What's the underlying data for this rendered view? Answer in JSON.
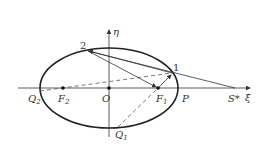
{
  "diagram": {
    "type": "ellipse-geometry",
    "axes": {
      "x_label": "ξ",
      "y_label": "η"
    },
    "ellipse": {
      "cx": 109,
      "cy": 88,
      "rx": 69,
      "ry": 40
    },
    "points": {
      "origin": {
        "label": "O"
      },
      "focus_left": {
        "label": "F",
        "sub": "2"
      },
      "focus_right": {
        "label": "F",
        "sub": "1"
      },
      "vertex_right": {
        "label": "P"
      },
      "external_source": {
        "label": "S*"
      },
      "q_left": {
        "label": "Q",
        "sub": "2"
      },
      "q_bottom": {
        "label": "Q",
        "sub": "1"
      },
      "point_one": {
        "label": "1"
      },
      "point_two": {
        "label": "2"
      }
    },
    "colors": {
      "stroke": "#333333",
      "dashed": "#555555",
      "background": "#ffffff"
    }
  }
}
